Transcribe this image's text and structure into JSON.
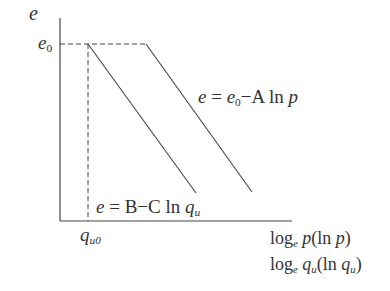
{
  "axes": {
    "y_label": "e",
    "e0_label": "e",
    "e0_sub": "0",
    "qu0_label": "q",
    "qu0_sub": "u0",
    "x_label_line1": {
      "log": "log",
      "log_sub": "e",
      "var": "p",
      "paren": "(ln ",
      "paren_var": "p",
      "close": ")"
    },
    "x_label_line2": {
      "log": "log",
      "log_sub": "e",
      "var": "q",
      "var_sub": "u",
      "paren": "(ln ",
      "paren_var": "q",
      "paren_sub": "u",
      "close": ")"
    }
  },
  "equations": {
    "upper": {
      "lhs": "e",
      "eq": " = ",
      "e0": "e",
      "e0_sub": "0",
      "rest": "−A ln ",
      "var": "p"
    },
    "lower": {
      "lhs": "e",
      "eq": " = ",
      "rest": "B−C ln ",
      "var": "q",
      "var_sub": "u"
    }
  },
  "colors": {
    "line": "#444444",
    "text": "#333333",
    "background": "#ffffff"
  }
}
